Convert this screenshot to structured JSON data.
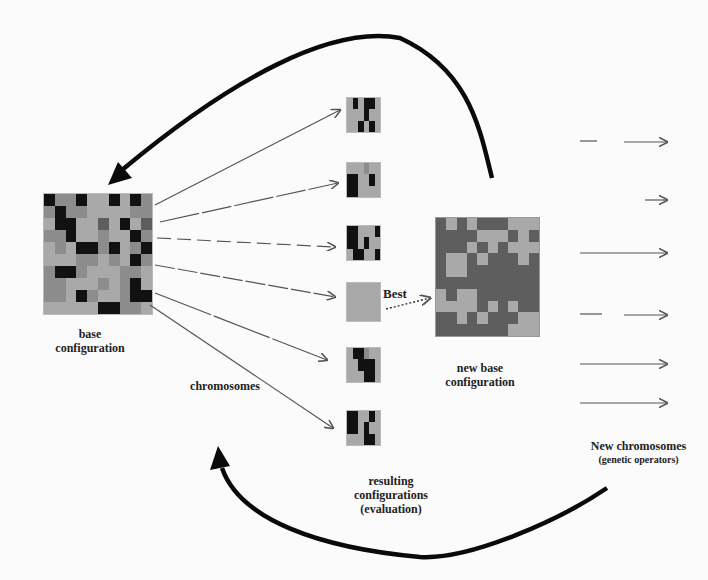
{
  "labels": {
    "base": [
      "base",
      "configuration"
    ],
    "chromosomes": "chromosomes",
    "best": "Best",
    "new_base": [
      "new base",
      "configuration"
    ],
    "resulting": [
      "resulting",
      "configurations",
      "(evaluation)"
    ],
    "new_chromosomes": [
      "New chromosomes",
      "(genetic operators)"
    ]
  },
  "colors": {
    "black": "#111111",
    "dark": "#5e5e5e",
    "mid": "#8c8c8c",
    "light": "#a9a9a9",
    "arrow": "#555555",
    "curve": "#0a0a0a"
  },
  "base_grid": [
    "BmmBllBlBm",
    "mBmmllllmm",
    "lBBlldlBld",
    "mmBllmllBm",
    "lmlBBmBlmB",
    "lllmmlmlBm",
    "mBBmlllmml",
    "mmlllmlmBl",
    "mmlBmllmBB",
    "lllllBBmml"
  ],
  "new_base_grid": [
    "dldldddlll",
    "ddddllldld",
    "dddldldlll",
    "dlldldddld",
    "dllddddddd",
    "dddddddddd",
    "ldlldddddd",
    "lllldldldd",
    "ddldldddll",
    "dddddddlll"
  ],
  "chromosome_rows": [
    "lBlBBl|lllBll|llBlBl",
    "lllmll|BBllBl|BBllll",
    "BBlllB|BBlBll|lBBllB",
    "llllll|llllll|llllll",
    "lBBmll|llBBBl|lllBBl",
    "BBllBl|BBlBll|lllBBl"
  ]
}
